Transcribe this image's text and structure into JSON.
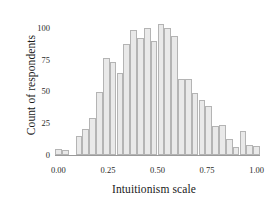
{
  "chart_data": {
    "type": "bar",
    "title": "",
    "subtitle": "",
    "xlabel": "Intuitionism scale",
    "ylabel": "Count of respondents",
    "xlim": [
      -0.0172,
      1.0172
    ],
    "ylim": [
      0,
      107
    ],
    "grid": false,
    "legend": null,
    "bin_width": 0.0345,
    "xtick_labels": [
      "0.00",
      "0.25",
      "0.50",
      "0.75",
      "1.00"
    ],
    "xtick_values": [
      0.0,
      0.25,
      0.5,
      0.75,
      1.0
    ],
    "ytick_labels": [
      "0",
      "25",
      "50",
      "75",
      "100"
    ],
    "ytick_values": [
      0,
      25,
      50,
      75,
      100
    ],
    "bar_fill": "#e9e9e9",
    "bar_edge": "#b4b4b4",
    "axis_color": "#9a9a9a",
    "categories": [
      "0.00",
      "0.03",
      "0.07",
      "0.10",
      "0.14",
      "0.17",
      "0.21",
      "0.24",
      "0.28",
      "0.31",
      "0.34",
      "0.38",
      "0.41",
      "0.45",
      "0.48",
      "0.52",
      "0.55",
      "0.59",
      "0.62",
      "0.66",
      "0.69",
      "0.72",
      "0.76",
      "0.79",
      "0.83",
      "0.86",
      "0.90",
      "0.93",
      "0.97",
      "1.00"
    ],
    "x": [
      0.0,
      0.034,
      0.069,
      0.103,
      0.138,
      0.172,
      0.207,
      0.241,
      0.276,
      0.31,
      0.345,
      0.379,
      0.414,
      0.448,
      0.483,
      0.517,
      0.552,
      0.586,
      0.621,
      0.655,
      0.69,
      0.724,
      0.759,
      0.793,
      0.828,
      0.862,
      0.897,
      0.931,
      0.966,
      1.0
    ],
    "values": [
      5,
      4,
      0,
      15,
      21,
      29,
      50,
      77,
      74,
      65,
      88,
      99,
      93,
      101,
      90,
      104,
      101,
      94,
      60,
      60,
      49,
      44,
      39,
      23,
      24,
      13,
      6,
      19,
      8,
      7
    ]
  },
  "axes": {
    "ylabel_text": "Count of respondents",
    "xlabel_text": "Intuitionism scale"
  }
}
